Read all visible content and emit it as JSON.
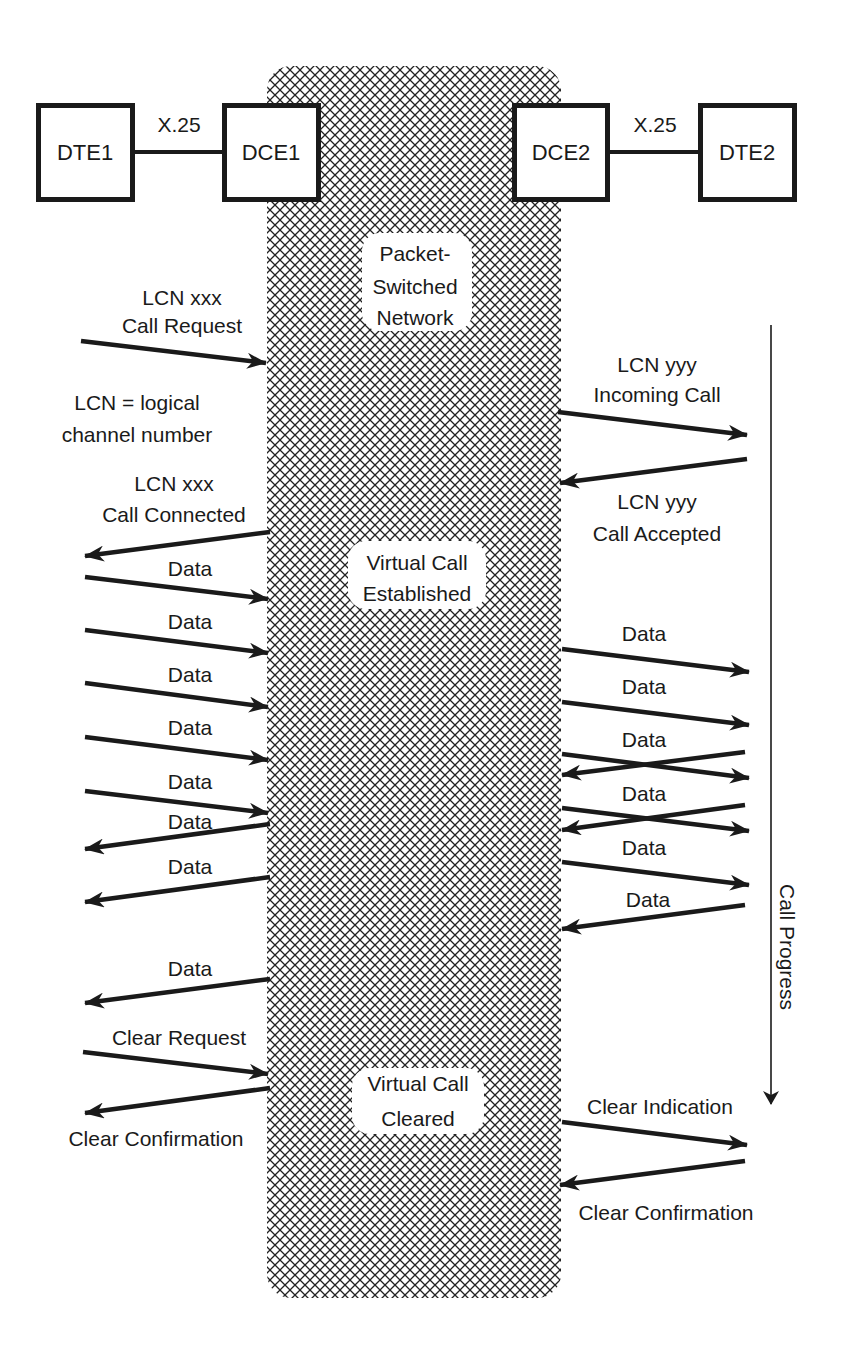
{
  "colors": {
    "ink": "#1a1a1a",
    "background": "#ffffff",
    "hatch": "#222222"
  },
  "nodes": [
    {
      "id": "dte1",
      "label": "DTE1",
      "x": 37,
      "y": 104,
      "w": 96,
      "h": 96
    },
    {
      "id": "dce1",
      "label": "DCE1",
      "x": 223,
      "y": 104,
      "w": 96,
      "h": 96
    },
    {
      "id": "dce2",
      "label": "DCE2",
      "x": 513,
      "y": 104,
      "w": 95,
      "h": 96
    },
    {
      "id": "dte2",
      "label": "DTE2",
      "x": 699,
      "y": 104,
      "w": 96,
      "h": 96
    }
  ],
  "links": [
    {
      "label": "X.25",
      "from": "dte1",
      "to": "dce1"
    },
    {
      "label": "X.25",
      "from": "dce2",
      "to": "dte2"
    }
  ],
  "network": {
    "label_lines": [
      "Packet-",
      "Switched",
      "Network"
    ],
    "virtual_call_established": [
      "Virtual Call",
      "Established"
    ],
    "virtual_call_cleared": [
      "Virtual Call",
      "Cleared"
    ]
  },
  "left_side": {
    "call_request": [
      "LCN xxx",
      "Call Request"
    ],
    "lcn_definition": [
      "LCN = logical",
      "channel number"
    ],
    "call_connected": [
      "LCN xxx",
      "Call Connected"
    ],
    "data_label": "Data",
    "clear_request": "Clear Request",
    "clear_confirmation": "Clear Confirmation"
  },
  "right_side": {
    "incoming_call": [
      "LCN yyy",
      "Incoming Call"
    ],
    "call_accepted": [
      "LCN yyy",
      "Call Accepted"
    ],
    "data_label": "Data",
    "clear_indication": "Clear Indication",
    "clear_confirmation": "Clear Confirmation"
  },
  "call_progress_label": "Call Progress",
  "arrows": [
    {
      "id": "call-request",
      "x1": 81,
      "y1": 341,
      "x2": 266,
      "y2": 363
    },
    {
      "id": "incoming-call",
      "x1": 558,
      "y1": 412,
      "x2": 747,
      "y2": 435
    },
    {
      "id": "call-accepted",
      "x1": 747,
      "y1": 459,
      "x2": 560,
      "y2": 483
    },
    {
      "id": "call-connected",
      "x1": 270,
      "y1": 532,
      "x2": 85,
      "y2": 556
    },
    {
      "id": "left-data-1",
      "x1": 85,
      "y1": 577,
      "x2": 268,
      "y2": 599
    },
    {
      "id": "left-data-2",
      "x1": 85,
      "y1": 630,
      "x2": 268,
      "y2": 653
    },
    {
      "id": "left-data-3",
      "x1": 85,
      "y1": 683,
      "x2": 268,
      "y2": 707
    },
    {
      "id": "left-data-4",
      "x1": 85,
      "y1": 737,
      "x2": 268,
      "y2": 760
    },
    {
      "id": "left-data-5",
      "x1": 85,
      "y1": 791,
      "x2": 268,
      "y2": 813
    },
    {
      "id": "left-data-6",
      "x1": 270,
      "y1": 824,
      "x2": 85,
      "y2": 849
    },
    {
      "id": "left-data-7",
      "x1": 270,
      "y1": 877,
      "x2": 85,
      "y2": 902
    },
    {
      "id": "left-data-8",
      "x1": 270,
      "y1": 979,
      "x2": 85,
      "y2": 1003
    },
    {
      "id": "clear-request",
      "x1": 83,
      "y1": 1052,
      "x2": 268,
      "y2": 1074
    },
    {
      "id": "left-clear-confirmation",
      "x1": 270,
      "y1": 1088,
      "x2": 85,
      "y2": 1113
    },
    {
      "id": "right-data-1",
      "x1": 562,
      "y1": 649,
      "x2": 749,
      "y2": 672
    },
    {
      "id": "right-data-2",
      "x1": 562,
      "y1": 702,
      "x2": 749,
      "y2": 725
    },
    {
      "id": "right-data-3a",
      "x1": 562,
      "y1": 754,
      "x2": 749,
      "y2": 778
    },
    {
      "id": "right-data-3b",
      "x1": 745,
      "y1": 752,
      "x2": 562,
      "y2": 775
    },
    {
      "id": "right-data-4a",
      "x1": 562,
      "y1": 808,
      "x2": 749,
      "y2": 831
    },
    {
      "id": "right-data-4b",
      "x1": 745,
      "y1": 805,
      "x2": 562,
      "y2": 830
    },
    {
      "id": "right-data-5",
      "x1": 562,
      "y1": 862,
      "x2": 749,
      "y2": 885
    },
    {
      "id": "right-data-6",
      "x1": 745,
      "y1": 905,
      "x2": 562,
      "y2": 929
    },
    {
      "id": "clear-indication",
      "x1": 562,
      "y1": 1122,
      "x2": 747,
      "y2": 1145
    },
    {
      "id": "right-clear-confirmation",
      "x1": 745,
      "y1": 1161,
      "x2": 560,
      "y2": 1185
    }
  ]
}
